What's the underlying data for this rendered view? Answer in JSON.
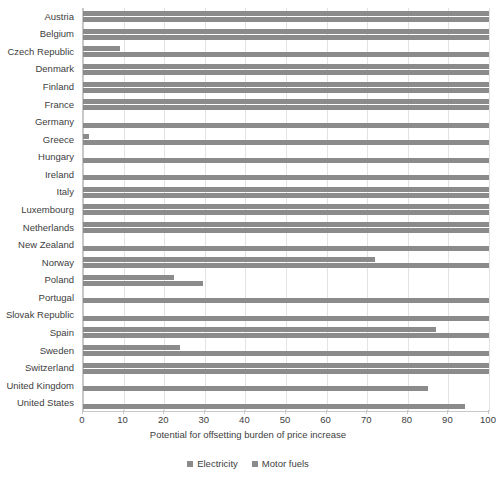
{
  "chart_data": {
    "type": "bar",
    "orientation": "horizontal",
    "title": "",
    "xlabel": "Potential for offsetting burden of price increase",
    "ylabel": "",
    "xlim": [
      0,
      100
    ],
    "xticks": [
      0,
      10,
      20,
      30,
      40,
      50,
      60,
      70,
      80,
      90,
      100
    ],
    "grid": true,
    "legend_position": "bottom",
    "categories": [
      "Austria",
      "Belgium",
      "Czech Republic",
      "Denmark",
      "Finland",
      "France",
      "Germany",
      "Greece",
      "Hungary",
      "Ireland",
      "Italy",
      "Luxembourg",
      "Netherlands",
      "New Zealand",
      "Norway",
      "Poland",
      "Portugal",
      "Slovak Republic",
      "Spain",
      "Sweden",
      "Switzerland",
      "United States"
    ],
    "series": [
      {
        "name": "Electricity",
        "color": "#8b8b8b",
        "values": [
          100,
          100,
          9,
          100,
          100,
          100,
          0,
          1.5,
          0,
          0,
          100,
          100,
          100,
          0,
          72,
          22.5,
          0,
          0,
          87,
          24,
          100,
          0
        ]
      },
      {
        "name": "Motor fuels",
        "color": "#8b8b8b",
        "values": [
          100,
          100,
          100,
          100,
          100,
          100,
          100,
          100,
          100,
          100,
          100,
          100,
          100,
          100,
          100,
          29.5,
          100,
          100,
          100,
          100,
          100,
          94
        ]
      }
    ]
  },
  "axis": {
    "x_title": "Potential for offsetting burden of price increase"
  },
  "legend": {
    "items": [
      {
        "label": "Electricity",
        "color": "#8b8b8b"
      },
      {
        "label": "Motor fuels",
        "color": "#8b8b8b"
      }
    ]
  },
  "extra_category": {
    "name": "United Kingdom",
    "electricity": 0,
    "motor_fuels": 85
  }
}
